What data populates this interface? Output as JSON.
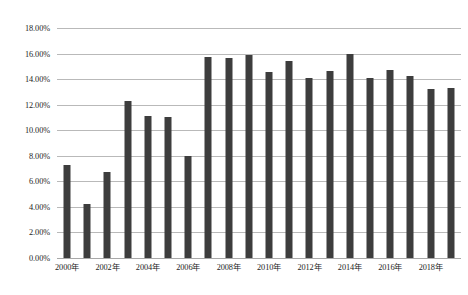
{
  "chart_data": {
    "type": "bar",
    "title": "",
    "subtitle": "",
    "xlabel": "",
    "ylabel": "",
    "grid": true,
    "legend": false,
    "legend_position": "none",
    "bar_color": "#3d3d3d",
    "gridline_color": "#b9b9b9",
    "background_color": "#ffffff",
    "ylim": [
      0,
      18
    ],
    "y_tick_labels": [
      "0.00%",
      "2.00%",
      "4.00%",
      "6.00%",
      "8.00%",
      "10.00%",
      "12.00%",
      "14.00%",
      "16.00%",
      "18.00%"
    ],
    "y_tick_values": [
      0,
      2,
      4,
      6,
      8,
      10,
      12,
      14,
      16,
      18
    ],
    "categories": [
      "2000年",
      "2001年",
      "2002年",
      "2003年",
      "2004年",
      "2005年",
      "2006年",
      "2007年",
      "2008年",
      "2009年",
      "2010年",
      "2011年",
      "2012年",
      "2013年",
      "2014年",
      "2015年",
      "2016年",
      "2017年",
      "2018年",
      "2019年"
    ],
    "x_tick_labels_shown": [
      "2000年",
      "2002年",
      "2004年",
      "2006年",
      "2008年",
      "2010年",
      "2012年",
      "2014年",
      "2016年",
      "2018年"
    ],
    "values": [
      7.25,
      4.2,
      6.75,
      12.3,
      11.1,
      11.0,
      8.0,
      15.75,
      15.65,
      15.85,
      14.55,
      15.45,
      14.05,
      14.65,
      15.95,
      14.1,
      14.7,
      14.25,
      13.2,
      13.3
    ]
  },
  "caption": {
    "text": "",
    "visible": false
  }
}
